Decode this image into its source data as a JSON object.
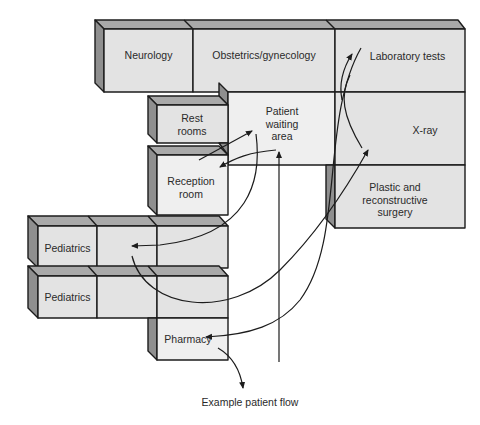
{
  "diagram": {
    "caption": "Example patient flow",
    "colors": {
      "front_face": "#e3e3e3",
      "light_face": "#efefef",
      "top_face": "#a9a9a9",
      "side_face": "#8f8f8f",
      "outline": "#1c1c1c",
      "background": "#ffffff"
    },
    "rooms": {
      "neurology": "Neurology",
      "obstetrics": "Obstetrics/gynecology",
      "laboratory": "Laboratory tests",
      "waiting": "Patient waiting area",
      "xray": "X-ray",
      "plastic": "Plastic and reconstructive surgery",
      "restrooms": "Rest rooms",
      "reception": "Reception room",
      "pediatrics_1": "Pediatrics",
      "pediatrics_2": "Pediatrics",
      "pharmacy": "Pharmacy"
    },
    "flow_description": "Arrows trace an example patient path: reception, waiting area, rest rooms, laboratory tests, X-ray, pediatrics, pharmacy and exit."
  }
}
